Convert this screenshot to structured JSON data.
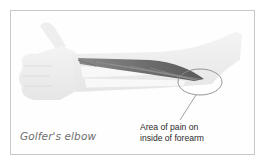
{
  "figure": {
    "caption": "Golfer's elbow",
    "annotation": {
      "line1": "Area of pain on",
      "line2": "inside of forearm"
    },
    "colors": {
      "border": "#c8c8c8",
      "arm": "#ececec",
      "muscle": "#6a6a6a",
      "highlight_circle": "#8a8a8a"
    }
  }
}
